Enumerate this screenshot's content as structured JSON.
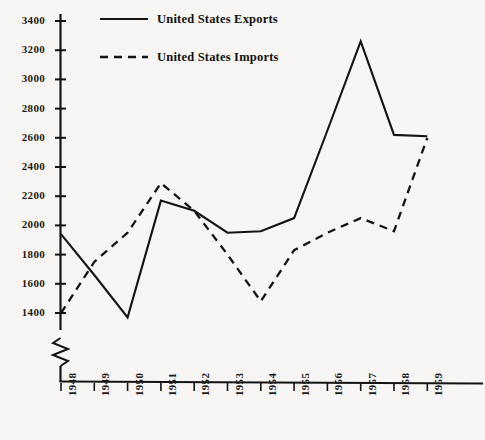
{
  "chart_data": {
    "type": "line",
    "title": "",
    "subtitle": "",
    "xlabel": "",
    "ylabel": "",
    "categories": [
      "1948",
      "1949",
      "1950",
      "1951",
      "1952",
      "1953",
      "1954",
      "1955",
      "1956",
      "1957",
      "1958",
      "1959"
    ],
    "series": [
      {
        "name": "United States Exports",
        "style": "solid",
        "color": "#141414",
        "values": [
          1940,
          1660,
          1370,
          2170,
          2100,
          1950,
          1960,
          2050,
          2650,
          3260,
          2620,
          2610
        ]
      },
      {
        "name": "United States Imports",
        "style": "dashed",
        "color": "#141414",
        "values": [
          1400,
          1750,
          1950,
          2290,
          2100,
          1800,
          1480,
          1830,
          1950,
          2050,
          1960,
          2600
        ]
      }
    ],
    "ylim": [
      1300,
      3400
    ],
    "yticks": [
      3400,
      3200,
      3000,
      2800,
      2600,
      2400,
      2200,
      2000,
      1800,
      1600,
      1400
    ],
    "ytick_labels": [
      "3400",
      "3200",
      "3000",
      "2800",
      "2600",
      "2400",
      "2200",
      "2000",
      "1800",
      "1600",
      "1400"
    ],
    "grid": false,
    "axis_break": true,
    "legend_position": "top-center",
    "legend": [
      {
        "label": "United States Exports",
        "style": "solid"
      },
      {
        "label": "United States Imports",
        "style": "dashed"
      }
    ]
  },
  "axes": {
    "y_axis_name": "value-axis",
    "x_axis_name": "year-axis"
  }
}
